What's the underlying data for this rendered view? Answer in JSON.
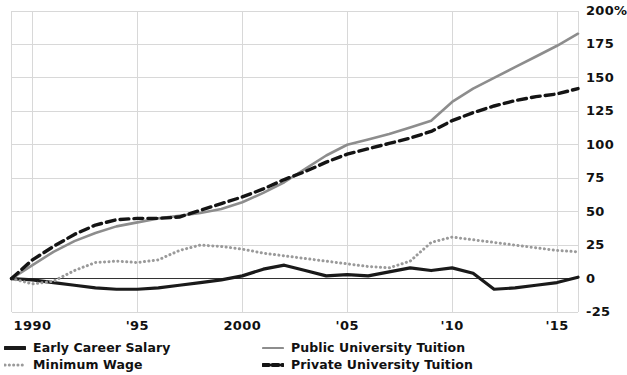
{
  "chart_data": {
    "type": "line",
    "title": "",
    "subtitle": "",
    "xlabel": "",
    "ylabel": "",
    "xlim": [
      1989,
      2016
    ],
    "ylim": [
      -25,
      200
    ],
    "grid": true,
    "legend_position": "bottom",
    "y_ticks": [
      -25,
      0,
      25,
      50,
      75,
      100,
      125,
      150,
      175,
      200
    ],
    "y_tick_labels": [
      "-25",
      "0",
      "25",
      "50",
      "75",
      "100",
      "125",
      "150",
      "175",
      "200%"
    ],
    "x_ticks": [
      1990,
      1995,
      2000,
      2005,
      2010,
      2015
    ],
    "x_tick_labels": [
      "1990",
      "'95",
      "2000",
      "'05",
      "'10",
      "'15"
    ],
    "x": [
      1989,
      1990,
      1991,
      1992,
      1993,
      1994,
      1995,
      1996,
      1997,
      1998,
      1999,
      2000,
      2001,
      2002,
      2003,
      2004,
      2005,
      2006,
      2007,
      2008,
      2009,
      2010,
      2011,
      2012,
      2013,
      2014,
      2015,
      2016
    ],
    "series": [
      {
        "name": "Early Career Salary",
        "style": "solid",
        "color": "#1a1a1a",
        "width": 3.2,
        "values": [
          0,
          -1,
          -3,
          -5,
          -7,
          -8,
          -8,
          -7,
          -5,
          -3,
          -1,
          2,
          7,
          10,
          6,
          2,
          3,
          2,
          5,
          8,
          6,
          8,
          4,
          -8,
          -7,
          -5,
          -3,
          1
        ]
      },
      {
        "name": "Minimum Wage",
        "style": "dotted",
        "color": "#9a9a9a",
        "width": 3.0,
        "values": [
          0,
          -4,
          -2,
          6,
          12,
          13,
          12,
          14,
          21,
          25,
          24,
          22,
          19,
          17,
          15,
          13,
          11,
          9,
          8,
          13,
          27,
          31,
          29,
          27,
          25,
          23,
          21,
          20
        ]
      },
      {
        "name": "Public University Tuition",
        "style": "solid",
        "color": "#8d8d8d",
        "width": 2.6,
        "values": [
          0,
          10,
          20,
          28,
          34,
          39,
          42,
          45,
          47,
          49,
          52,
          57,
          64,
          72,
          82,
          92,
          100,
          104,
          108,
          113,
          118,
          132,
          142,
          150,
          158,
          166,
          174,
          183
        ]
      },
      {
        "name": "Private University Tuition",
        "style": "dashed",
        "color": "#141414",
        "width": 3.4,
        "values": [
          0,
          14,
          24,
          33,
          40,
          44,
          45,
          45,
          46,
          51,
          56,
          61,
          67,
          74,
          80,
          87,
          93,
          97,
          101,
          105,
          110,
          118,
          124,
          129,
          133,
          136,
          138,
          142
        ]
      }
    ]
  },
  "axis": {
    "y_labels": [
      "200%",
      "175",
      "150",
      "125",
      "100",
      "75",
      "50",
      "25",
      "0",
      "-25"
    ],
    "x_labels": [
      "1990",
      "'95",
      "2000",
      "'05",
      "'10",
      "'15"
    ]
  },
  "legend": {
    "items": [
      {
        "label": "Early Career Salary",
        "style": "solid",
        "color": "#1a1a1a"
      },
      {
        "label": "Minimum Wage",
        "style": "dotted",
        "color": "#9a9a9a"
      },
      {
        "label": "Public University Tuition",
        "style": "solid-thin",
        "color": "#8d8d8d"
      },
      {
        "label": "Private University Tuition",
        "style": "dashed",
        "color": "#141414"
      }
    ]
  },
  "colors": {
    "grid": "#d8d8d8",
    "zero_line": "#333333",
    "text": "#111111",
    "background": "#ffffff"
  }
}
